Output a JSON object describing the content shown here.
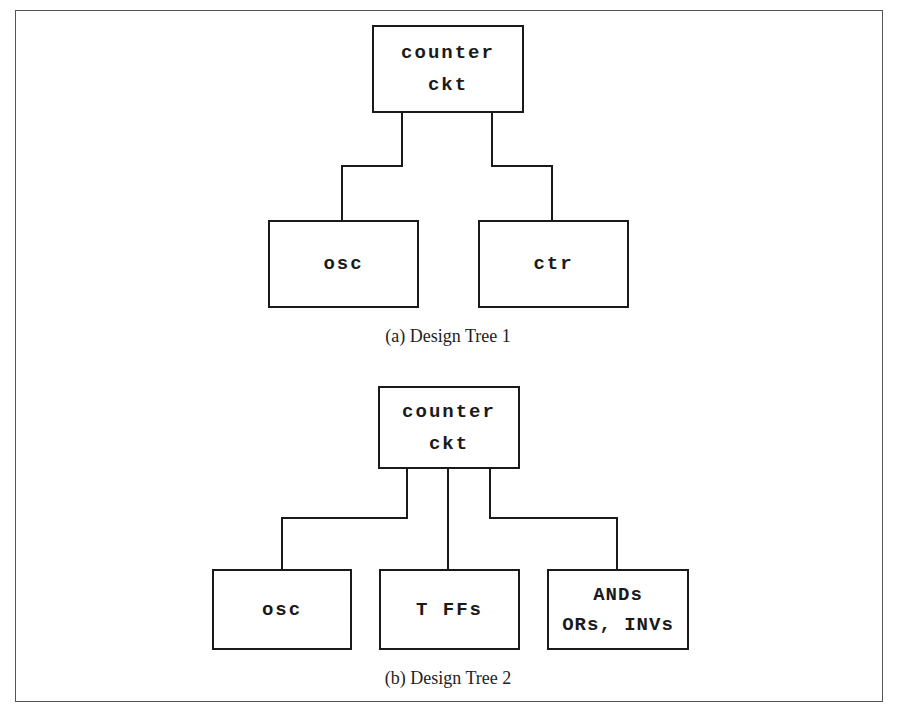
{
  "figure": {
    "tree1": {
      "caption": "(a) Design Tree 1",
      "root": {
        "line1": "counter",
        "line2": "ckt"
      },
      "children": [
        {
          "label": "osc"
        },
        {
          "label": "ctr"
        }
      ]
    },
    "tree2": {
      "caption": "(b) Design Tree 2",
      "root": {
        "line1": "counter",
        "line2": "ckt"
      },
      "children": [
        {
          "label": "osc"
        },
        {
          "label": "T FFs"
        },
        {
          "line1": "ANDs",
          "line2": "ORs, INVs"
        }
      ]
    }
  }
}
